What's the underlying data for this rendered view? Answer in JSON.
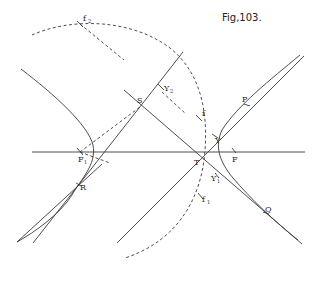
{
  "figure": {
    "title": "Fig,103.",
    "labels": {
      "f2": {
        "main": "f",
        "sub": "2"
      },
      "f": {
        "main": "f",
        "sub": ""
      },
      "f1": {
        "main": "f",
        "sub": "1"
      },
      "S": {
        "main": "S",
        "sub": ""
      },
      "Y2": {
        "main": "Y",
        "sub": "2"
      },
      "Y": {
        "main": "Y",
        "sub": ""
      },
      "Y1": {
        "main": "Y",
        "sub": "1"
      },
      "P": {
        "main": "P",
        "sub": ""
      },
      "Q": {
        "main": "Q",
        "sub": ""
      },
      "R": {
        "main": "R",
        "sub": ""
      },
      "T": {
        "main": "T",
        "sub": ""
      },
      "F": {
        "main": "F",
        "sub": ""
      },
      "F1": {
        "main": "F",
        "sub": "1"
      }
    }
  }
}
